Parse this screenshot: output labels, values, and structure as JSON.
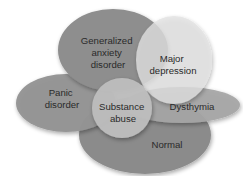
{
  "diagram": {
    "title": "",
    "background": "#ffffff",
    "regions": [
      {
        "id": "normal",
        "label_lines": [
          "Normal"
        ],
        "color": "#8b8b8b"
      },
      {
        "id": "panic",
        "label_lines": [
          "Panic",
          "disorder"
        ],
        "color": "#949494"
      },
      {
        "id": "gad",
        "label_lines": [
          "Generalized",
          "anxiety",
          "disorder"
        ],
        "color": "#8e8e8e"
      },
      {
        "id": "dysthymia",
        "label_lines": [
          "Dysthymia"
        ],
        "color": "#a6a6a6"
      },
      {
        "id": "major_depression",
        "label_lines": [
          "Major",
          "depression"
        ],
        "color": "#d9d9d9"
      },
      {
        "id": "substance_abuse",
        "label_lines": [
          "Substance",
          "abuse"
        ],
        "color": "#bdbdbd"
      }
    ]
  }
}
